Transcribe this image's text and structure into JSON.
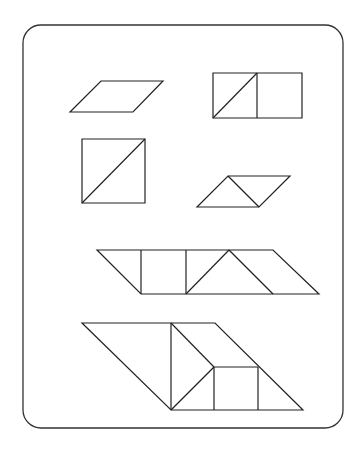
{
  "figure": {
    "frame": {
      "x": 23,
      "y": 25,
      "width": 320,
      "height": 403,
      "radius": 18,
      "color": "#333333"
    },
    "line_color": "#222222",
    "shapes": [
      {
        "name": "parallelogram-small",
        "points": "101,81 163,81 133,112 70,112"
      },
      {
        "name": "rectangle-two-squares",
        "points": "213,73 302,73 302,118 213,118",
        "inner_lines": [
          "257,73 257,118",
          "213,118 257,73"
        ]
      },
      {
        "name": "square-split-diagonal",
        "points": "82,139 145,139 145,203 82,203",
        "inner_lines": [
          "82,203 145,139"
        ]
      },
      {
        "name": "parallelogram-two-triangles",
        "points": "228,176 290,176 259,207 197,207",
        "inner_lines": [
          "228,176 259,207"
        ]
      },
      {
        "name": "long-parallelogram-row",
        "points": "97,250 273,250 319,294 141,294",
        "inner_lines": [
          "141,250 141,294",
          "186,250 186,294",
          "186,294 229,250",
          "229,250 273,294"
        ]
      },
      {
        "name": "large-composite-trapezoid",
        "points": "82,323 215,323 303,410 171,410",
        "inner_lines": [
          "171,323 171,410",
          "171,323 214,367",
          "214,367 171,410",
          "214,367 258,367",
          "214,367 214,410",
          "258,367 258,410"
        ]
      }
    ]
  }
}
